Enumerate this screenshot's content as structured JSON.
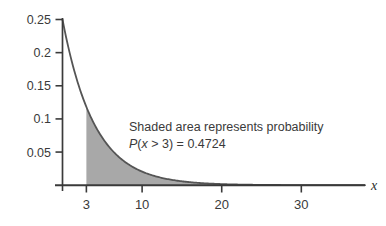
{
  "chart_data": {
    "type": "area",
    "title": "",
    "subtitle": "",
    "xlabel": "x",
    "ylabel": "",
    "xlim": [
      0,
      38
    ],
    "ylim": [
      0,
      0.25
    ],
    "grid": false,
    "legend": false,
    "distribution": "exponential",
    "decay_rate": 0.25,
    "peak_value": 0.25,
    "function_note": "f(x) = 0.25e^(-0.25x)",
    "x_ticks": [
      3,
      10,
      20,
      30
    ],
    "x_tick_labels": [
      "3",
      "10",
      "20",
      "30"
    ],
    "y_ticks": [
      0.05,
      0.1,
      0.15,
      0.2,
      0.25
    ],
    "y_tick_labels": [
      "0.05",
      "0.1",
      "0.15",
      "0.2",
      "0.25"
    ],
    "shaded_region": {
      "from": 3,
      "to": 38,
      "probability": 0.4724,
      "fill_color": "#a8a8a8"
    },
    "curve_color": "#555555",
    "axis_color": "#3a3a3a",
    "series": [
      {
        "name": "exponential pdf",
        "x": [
          0,
          1,
          2,
          3,
          4,
          5,
          6,
          7,
          8,
          9,
          10,
          12,
          14,
          16,
          18,
          20,
          24,
          28,
          32,
          36,
          38
        ],
        "values": [
          0.25,
          0.1947,
          0.1516,
          0.1181,
          0.092,
          0.0716,
          0.0558,
          0.0434,
          0.0338,
          0.0264,
          0.0205,
          0.0124,
          0.0076,
          0.0046,
          0.0028,
          0.0017,
          0.0006,
          0.0002,
          0.0001,
          0.0,
          0.0
        ]
      }
    ],
    "annotations": [
      {
        "id": "shaded-area-note",
        "line1": "Shaded area represents probability",
        "line2_prefix": "P",
        "line2_open": "(",
        "line2_var": "x",
        "line2_relation": " > 3) = ",
        "line2_value": "0.4724",
        "line2_full": "P(x > 3) = 0.4724"
      }
    ]
  },
  "axes": {
    "x_axis_name": "x",
    "y_axis_name": ""
  }
}
